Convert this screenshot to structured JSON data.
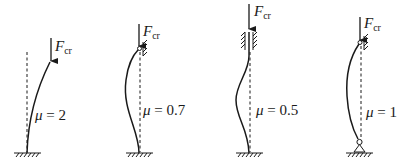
{
  "figure": {
    "colors": {
      "ink": "#1a1a1a",
      "background": "#ffffff"
    },
    "panels": [
      {
        "id": "fixed-free",
        "load_symbol": "F",
        "load_subscript": "cr",
        "mu_symbol": "μ",
        "equals": " = ",
        "mu_value": "2",
        "top_support": "free",
        "bottom_support": "fixed"
      },
      {
        "id": "fixed-pinned",
        "load_symbol": "F",
        "load_subscript": "cr",
        "mu_symbol": "μ",
        "equals": " = ",
        "mu_value": "0.7",
        "top_support": "pinned-roller",
        "bottom_support": "fixed"
      },
      {
        "id": "fixed-fixed",
        "load_symbol": "F",
        "load_subscript": "cr",
        "mu_symbol": "μ",
        "equals": " = ",
        "mu_value": "0.5",
        "top_support": "sliding-clamp",
        "bottom_support": "fixed"
      },
      {
        "id": "pinned-pinned",
        "load_symbol": "F",
        "load_subscript": "cr",
        "mu_symbol": "μ",
        "equals": " = ",
        "mu_value": "1",
        "top_support": "pinned-roller",
        "bottom_support": "pinned"
      }
    ]
  }
}
